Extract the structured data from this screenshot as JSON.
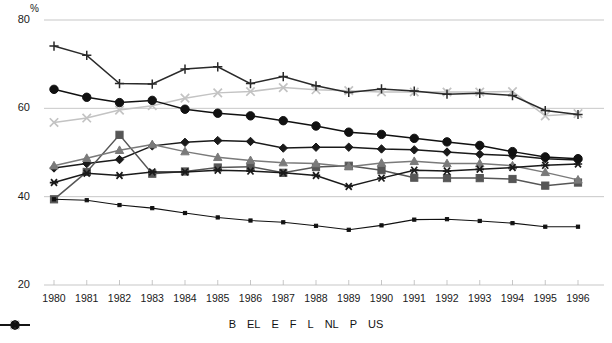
{
  "chart_data": {
    "type": "line",
    "title": "",
    "xlabel": "",
    "ylabel": "%",
    "ylim": [
      20,
      80
    ],
    "yticks": [
      20,
      40,
      60,
      80
    ],
    "grid": true,
    "legend_position": "bottom",
    "x": [
      1980,
      1981,
      1982,
      1983,
      1984,
      1985,
      1986,
      1987,
      1988,
      1989,
      1990,
      1991,
      1992,
      1993,
      1994,
      1995,
      1996
    ],
    "categories": [
      "1980",
      "1981",
      "1982",
      "1983",
      "1984",
      "1985",
      "1986",
      "1987",
      "1988",
      "1989",
      "1990",
      "1991",
      "1992",
      "1993",
      "1994",
      "1995",
      "1996"
    ],
    "series": [
      {
        "name": "B",
        "marker": "diamond",
        "color": "#1a1a1a",
        "values": [
          46.5,
          47.5,
          48.4,
          51.5,
          52.3,
          52.7,
          52.5,
          51.0,
          51.2,
          51.2,
          50.8,
          50.6,
          50.1,
          49.6,
          49.3,
          48.6,
          48.3
        ]
      },
      {
        "name": "EL",
        "marker": "square",
        "color": "#565656",
        "values": [
          39.4,
          45.6,
          54.0,
          45.2,
          45.7,
          46.6,
          46.8,
          45.4,
          46.7,
          47.0,
          46.0,
          44.3,
          44.2,
          44.2,
          44.0,
          42.5,
          43.2
        ]
      },
      {
        "name": "E",
        "marker": "triangle",
        "color": "#7a7a7a",
        "values": [
          47.0,
          48.7,
          50.5,
          51.8,
          50.2,
          48.9,
          48.2,
          47.7,
          47.5,
          46.8,
          47.6,
          48.0,
          47.5,
          47.5,
          47.0,
          45.5,
          43.8
        ]
      },
      {
        "name": "F",
        "marker": "x",
        "color": "#c3c3c3",
        "values": [
          56.8,
          57.8,
          59.6,
          60.6,
          62.3,
          63.5,
          63.8,
          64.7,
          64.2,
          64.0,
          63.7,
          63.7,
          63.7,
          63.7,
          63.8,
          58.3,
          58.8
        ]
      },
      {
        "name": "L",
        "marker": "star",
        "color": "#1a1a1a",
        "values": [
          43.2,
          45.3,
          44.8,
          45.6,
          45.6,
          46.0,
          45.8,
          45.4,
          44.8,
          42.3,
          44.2,
          46.0,
          45.8,
          46.2,
          46.6,
          47.1,
          47.4
        ]
      },
      {
        "name": "NL",
        "marker": "circle",
        "color": "#111111",
        "values": [
          64.3,
          62.5,
          61.3,
          61.8,
          59.8,
          58.9,
          58.3,
          57.2,
          56.0,
          54.6,
          54.1,
          53.2,
          52.4,
          51.6,
          50.2,
          49.0,
          48.6
        ]
      },
      {
        "name": "P",
        "marker": "plus",
        "color": "#2a2a2a",
        "values": [
          74.1,
          72.0,
          65.6,
          65.5,
          68.9,
          69.4,
          65.6,
          67.2,
          65.1,
          63.6,
          64.4,
          63.9,
          63.2,
          63.4,
          62.9,
          59.5,
          58.6
        ]
      },
      {
        "name": "US",
        "marker": "dot",
        "color": "#111111",
        "values": [
          39.4,
          39.2,
          38.1,
          37.4,
          36.3,
          35.3,
          34.6,
          34.2,
          33.4,
          32.5,
          33.5,
          34.8,
          34.9,
          34.5,
          34.0,
          33.2,
          33.2
        ]
      }
    ]
  },
  "axis": {
    "unit_label": "%",
    "y_labels": [
      "80",
      "60",
      "40",
      "20"
    ],
    "x_labels": [
      "1980",
      "1981",
      "1982",
      "1983",
      "1984",
      "1985",
      "1986",
      "1987",
      "1988",
      "1989",
      "1990",
      "1991",
      "1992",
      "1993",
      "1994",
      "1995",
      "1996"
    ]
  },
  "legend": {
    "items": [
      {
        "label": "B",
        "marker": "diamond",
        "color": "#1a1a1a"
      },
      {
        "label": "EL",
        "marker": "square",
        "color": "#565656"
      },
      {
        "label": "E",
        "marker": "triangle",
        "color": "#7a7a7a"
      },
      {
        "label": "F",
        "marker": "x",
        "color": "#c3c3c3"
      },
      {
        "label": "L",
        "marker": "star",
        "color": "#1a1a1a"
      },
      {
        "label": "NL",
        "marker": "circle",
        "color": "#111111"
      },
      {
        "label": "P",
        "marker": "plus",
        "color": "#2a2a2a"
      },
      {
        "label": "US",
        "marker": "dot",
        "color": "#111111"
      }
    ]
  }
}
